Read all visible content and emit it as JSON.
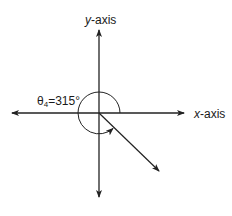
{
  "diagram": {
    "y_axis_label": {
      "var": "y",
      "suffix": "-axis"
    },
    "x_axis_label": {
      "var": "x",
      "suffix": "-axis"
    },
    "angle_label": {
      "symbol": "θ",
      "subscript": "4",
      "equals": "=",
      "value": "315°"
    },
    "angle_degrees": 315,
    "colors": {
      "stroke": "#222222",
      "background": "#ffffff"
    }
  }
}
